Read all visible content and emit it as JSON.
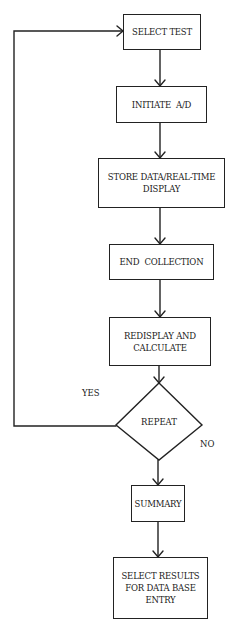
{
  "diagram": {
    "type": "flowchart",
    "stroke_color": "#222222",
    "background_color": "#ffffff",
    "nodes": [
      {
        "id": "select-test",
        "shape": "rect",
        "label": "SELECT TEST"
      },
      {
        "id": "initiate-ad",
        "shape": "rect",
        "label": "INITIATE  A/D"
      },
      {
        "id": "store-data",
        "shape": "rect",
        "label": "STORE DATA/REAL-TIME\nDISPLAY"
      },
      {
        "id": "end-collection",
        "shape": "rect",
        "label": "END  COLLECTION"
      },
      {
        "id": "redisplay",
        "shape": "rect",
        "label": "REDISPLAY AND\nCALCULATE"
      },
      {
        "id": "repeat",
        "shape": "diamond",
        "label": "REPEAT"
      },
      {
        "id": "summary",
        "shape": "rect",
        "label": "SUMMARY"
      },
      {
        "id": "select-results",
        "shape": "rect",
        "label": "SELECT RESULTS\nFOR DATA BASE\nENTRY"
      }
    ],
    "edges": [
      {
        "from": "select-test",
        "to": "initiate-ad",
        "label": ""
      },
      {
        "from": "initiate-ad",
        "to": "store-data",
        "label": ""
      },
      {
        "from": "store-data",
        "to": "end-collection",
        "label": ""
      },
      {
        "from": "end-collection",
        "to": "redisplay",
        "label": ""
      },
      {
        "from": "redisplay",
        "to": "repeat",
        "label": ""
      },
      {
        "from": "repeat",
        "to": "select-test",
        "label": "YES"
      },
      {
        "from": "repeat",
        "to": "summary",
        "label": "NO"
      },
      {
        "from": "summary",
        "to": "select-results",
        "label": ""
      }
    ],
    "branch_labels": {
      "yes": "YES",
      "no": "NO"
    }
  }
}
